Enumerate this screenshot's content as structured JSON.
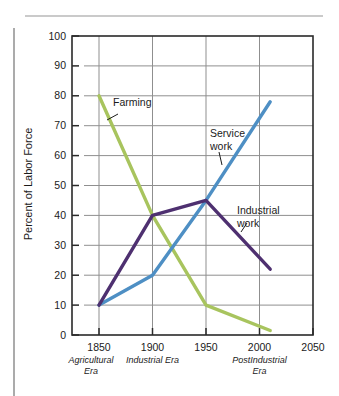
{
  "page": {
    "background": "#ffffff",
    "rules": {
      "top_color": "#cacaca",
      "left_color": "#ababab"
    }
  },
  "chart_data": {
    "type": "line",
    "title": "",
    "ylabel": "Percent of Labor Force",
    "xlabel": "",
    "ylim": [
      0,
      100
    ],
    "y_ticks": [
      0,
      10,
      20,
      30,
      40,
      50,
      60,
      70,
      80,
      90,
      100
    ],
    "x_ticks": [
      1850,
      1900,
      1950,
      2000,
      2050
    ],
    "x_gridlines": [
      1850,
      1900,
      1950,
      2000
    ],
    "grid": true,
    "legend": "inline-annotations",
    "colors": {
      "grid": "#8f8f8f",
      "frame": "#2a2a2a",
      "text": "#1b1b1b"
    },
    "era_labels": [
      {
        "lines": [
          "Agricultural",
          "Era"
        ],
        "year": 1850,
        "dx": -8
      },
      {
        "lines": [
          "Industrial Era"
        ],
        "year": 1900,
        "dx": 0
      },
      {
        "lines": [
          "PostIndustrial",
          "Era"
        ],
        "year": 2000,
        "dx": 0
      }
    ],
    "series": [
      {
        "name": "Farming",
        "color": "#a8c45e",
        "points": [
          [
            1850,
            80
          ],
          [
            1900,
            40
          ],
          [
            1950,
            10
          ],
          [
            2010,
            1.5
          ]
        ]
      },
      {
        "name": "Service work",
        "color": "#4e8fc4",
        "points": [
          [
            1850,
            10
          ],
          [
            1900,
            20
          ],
          [
            1950,
            45
          ],
          [
            2010,
            78
          ]
        ]
      },
      {
        "name": "Industrial work",
        "color": "#4e3070",
        "points": [
          [
            1850,
            10
          ],
          [
            1900,
            40
          ],
          [
            1950,
            45
          ],
          [
            2010,
            22
          ]
        ]
      }
    ],
    "annotations": [
      {
        "lines": [
          "Farming"
        ],
        "px": [
          113,
          106
        ],
        "leader": [
          [
            118,
            114
          ],
          [
            107,
            120
          ]
        ]
      },
      {
        "lines": [
          "Service",
          "work"
        ],
        "px": [
          210,
          137
        ],
        "leader": [
          [
            219,
            152
          ],
          [
            222,
            165
          ]
        ]
      },
      {
        "lines": [
          "Industrial",
          "work"
        ],
        "px": [
          237,
          214
        ],
        "leader": [
          [
            247,
            223
          ],
          [
            241,
            232
          ]
        ]
      }
    ]
  }
}
